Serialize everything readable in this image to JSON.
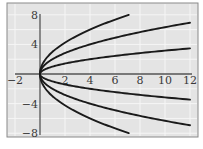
{
  "chart_data": {
    "type": "line",
    "title": "",
    "xlabel": "",
    "ylabel": "",
    "xlim": [
      -2,
      12
    ],
    "ylim": [
      -8,
      8
    ],
    "grid": true,
    "legend": null,
    "x_ticks": [
      -2,
      2,
      4,
      6,
      8,
      10,
      12
    ],
    "x_tick_labels": [
      "−2",
      "2",
      "4",
      "6",
      "8",
      "10",
      "12"
    ],
    "y_ticks": [
      8,
      4,
      -4,
      -8
    ],
    "y_tick_labels": [
      "8",
      "4",
      "−4",
      "−8"
    ],
    "series": [
      {
        "name": "y = 3√x",
        "x": [
          0,
          0.25,
          1,
          2,
          3,
          4,
          5,
          6,
          7.1
        ],
        "values": [
          0,
          1.5,
          3.0,
          4.24,
          5.2,
          6.0,
          6.71,
          7.35,
          7.99
        ]
      },
      {
        "name": "y = 2√x",
        "x": [
          0,
          0.25,
          1,
          2,
          4,
          6,
          8,
          10,
          12
        ],
        "values": [
          0,
          1.0,
          2.0,
          2.83,
          4.0,
          4.9,
          5.66,
          6.32,
          6.93
        ]
      },
      {
        "name": "y = √x",
        "x": [
          0,
          0.25,
          1,
          2,
          4,
          6,
          8,
          10,
          12
        ],
        "values": [
          0,
          0.5,
          1.0,
          1.41,
          2.0,
          2.45,
          2.83,
          3.16,
          3.46
        ]
      },
      {
        "name": "y = −√x",
        "x": [
          0,
          0.25,
          1,
          2,
          4,
          6,
          8,
          10,
          12
        ],
        "values": [
          0,
          -0.5,
          -1.0,
          -1.41,
          -2.0,
          -2.45,
          -2.83,
          -3.16,
          -3.46
        ]
      },
      {
        "name": "y = −2√x",
        "x": [
          0,
          0.25,
          1,
          2,
          4,
          6,
          8,
          10,
          12
        ],
        "values": [
          0,
          -1.0,
          -2.0,
          -2.83,
          -4.0,
          -4.9,
          -5.66,
          -6.32,
          -6.93
        ]
      },
      {
        "name": "y = −3√x",
        "x": [
          0,
          0.25,
          1,
          2,
          3,
          4,
          5,
          6,
          7.1
        ],
        "values": [
          0,
          -1.5,
          -3.0,
          -4.24,
          -5.2,
          -6.0,
          -6.71,
          -7.35,
          -7.99
        ]
      }
    ],
    "colors": {
      "panel_background": "#e4e4e4",
      "gridline": "#f6f6f6",
      "frame": "#8a8a8a",
      "axis": "#555555",
      "curve": "#1a1a1a",
      "tick_label": "#3a3a3a"
    }
  }
}
